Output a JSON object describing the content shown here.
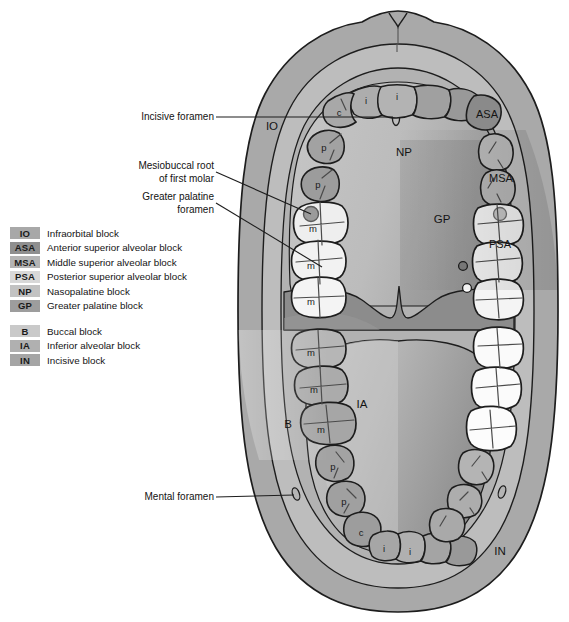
{
  "figure": {
    "bottom_caption": ""
  },
  "legend": {
    "maxillary": [
      {
        "code": "IO",
        "label": "Infraorbital block",
        "color": "#a8a8a8"
      },
      {
        "code": "ASA",
        "label": "Anterior superior alveolar block",
        "color": "#8f8f8f"
      },
      {
        "code": "MSA",
        "label": "Middle superior alveolar block",
        "color": "#b4b4b4"
      },
      {
        "code": "PSA",
        "label": "Posterior superior alveolar block",
        "color": "#d8d8d8"
      },
      {
        "code": "NP",
        "label": "Nasopalatine block",
        "color": "#c2c2c2"
      },
      {
        "code": "GP",
        "label": "Greater palatine block",
        "color": "#9d9d9d"
      }
    ],
    "mandibular": [
      {
        "code": "B",
        "label": "Buccal block",
        "color": "#c9c9c9"
      },
      {
        "code": "IA",
        "label": "Inferior alveolar block",
        "color": "#b0b0b0"
      },
      {
        "code": "IN",
        "label": "Incisive block",
        "color": "#a5a5a5"
      }
    ]
  },
  "callouts": [
    {
      "id": "incisive-foramen",
      "line1": "Incisive foramen",
      "line2": ""
    },
    {
      "id": "mesiobuccal-root",
      "line1": "Mesiobuccal root",
      "line2": "of first molar"
    },
    {
      "id": "greater-palatine",
      "line1": "Greater palatine",
      "line2": "foramen"
    },
    {
      "id": "mental-foramen",
      "line1": "Mental foramen",
      "line2": ""
    }
  ],
  "region_labels": {
    "io": "IO",
    "asa": "ASA",
    "msa": "MSA",
    "psa": "PSA",
    "np": "NP",
    "gp": "GP",
    "b": "B",
    "ia": "IA",
    "in": "IN"
  },
  "tooth_labels": {
    "maxillary_left": [
      "i",
      "c",
      "p",
      "p",
      "m",
      "m",
      "m"
    ],
    "maxillary_right": [
      "i"
    ],
    "mandibular_left": [
      "m",
      "m",
      "m",
      "p",
      "p",
      "c",
      "i"
    ],
    "mandibular_right": [
      "i"
    ]
  },
  "colors": {
    "page_bg": "#ffffff",
    "outline": "#1d1d1d",
    "lip_outer": "#a9a9a9",
    "lip_inner": "#9c9c9c",
    "vestibule": "#bdbdbd",
    "mucosa_band": "#b2b2b2",
    "palate": "#bfbfbf",
    "palate_shadow": "#9e9e9e",
    "soft_palate": "#8c8c8c",
    "tongue": "#aaaaaa",
    "tongue_light": "#c4c4c4",
    "floor": "#9a9a9a",
    "tooth_light": "#efefef",
    "tooth_mid": "#c6c6c6",
    "tooth_dark": "#9a9a9a",
    "tooth_white": "#f6f6f6",
    "groove": "#4a4a4a",
    "foramen_white": "#ffffff",
    "foramen_dark": "#7d7d7d"
  }
}
